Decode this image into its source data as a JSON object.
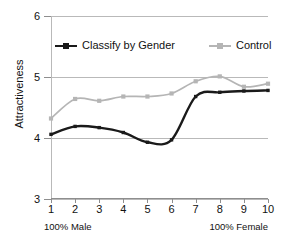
{
  "chart_data": {
    "type": "line",
    "title": "",
    "xlabel": "",
    "ylabel": "Attractiveness",
    "x": [
      1,
      2,
      3,
      4,
      5,
      6,
      7,
      8,
      9,
      10
    ],
    "xtick_labels": [
      "1",
      "2",
      "3",
      "4",
      "5",
      "6",
      "7",
      "8",
      "9",
      "10"
    ],
    "ytick_labels": [
      "6",
      "5",
      "4",
      "3"
    ],
    "ytick_values": [
      6,
      5,
      4,
      3
    ],
    "xlim": [
      1,
      10
    ],
    "ylim": [
      3,
      6
    ],
    "grid": "horizontal",
    "legend_position": "top-inside",
    "axis_end_labels": {
      "left": "100% Male",
      "right": "100% Female"
    },
    "series": [
      {
        "name": "Classify by Gender",
        "color": "#1a1a1a",
        "marker": "square",
        "values": [
          4.06,
          4.19,
          4.17,
          4.09,
          3.93,
          3.97,
          4.68,
          4.75,
          4.77,
          4.78
        ]
      },
      {
        "name": "Control",
        "color": "#b5b5b5",
        "marker": "square",
        "values": [
          4.32,
          4.64,
          4.61,
          4.68,
          4.68,
          4.73,
          4.93,
          5.01,
          4.84,
          4.89
        ]
      }
    ]
  },
  "legend": {
    "entries": [
      {
        "label": "Classify by Gender"
      },
      {
        "label": "Control"
      }
    ]
  },
  "colors": {
    "series_primary": "#1a1a1a",
    "series_secondary": "#b5b5b5",
    "gridline": "#b9b9b9",
    "axis": "#8e8e8e",
    "text": "#111111",
    "background": "#ffffff"
  }
}
